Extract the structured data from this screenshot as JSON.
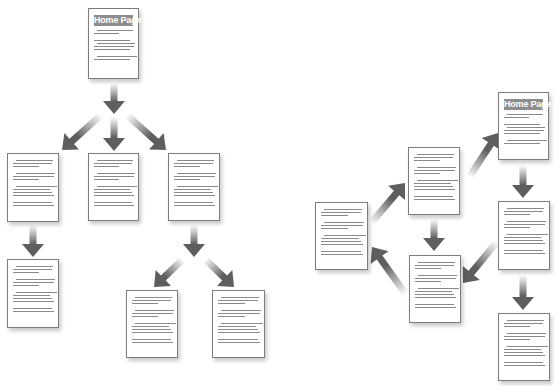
{
  "diagram": {
    "left_title_label": "Hierarchical site structure",
    "right_title_label": "Networked site structure",
    "home_label": "Home Page",
    "colors": {
      "arrow": "#5e5e5e",
      "page_border": "#7d7d7d",
      "header_bg": "#8d8d8d",
      "text_line": "#8a8a8a"
    },
    "hierarchy": {
      "nodes": [
        {
          "id": "home",
          "label": "Home Page",
          "x": 88,
          "y": 8,
          "w": 51,
          "h": 71
        },
        {
          "id": "l2a",
          "label": "",
          "x": 7,
          "y": 153,
          "w": 52,
          "h": 69
        },
        {
          "id": "l2b",
          "label": "",
          "x": 88,
          "y": 153,
          "w": 51,
          "h": 68
        },
        {
          "id": "l2c",
          "label": "",
          "x": 168,
          "y": 153,
          "w": 52,
          "h": 68
        },
        {
          "id": "l3a",
          "label": "",
          "x": 7,
          "y": 259,
          "w": 52,
          "h": 69
        },
        {
          "id": "l3b",
          "label": "",
          "x": 126,
          "y": 290,
          "w": 52,
          "h": 68
        },
        {
          "id": "l3c",
          "label": "",
          "x": 212,
          "y": 290,
          "w": 53,
          "h": 68
        }
      ],
      "edges": [
        [
          "home",
          "l2a"
        ],
        [
          "home",
          "l2b"
        ],
        [
          "home",
          "l2c"
        ],
        [
          "l2a",
          "l3a"
        ],
        [
          "l2c",
          "l3b"
        ],
        [
          "l2c",
          "l3c"
        ]
      ]
    },
    "network": {
      "nodes": [
        {
          "id": "home",
          "label": "Home Page",
          "x": 498,
          "y": 92,
          "w": 51,
          "h": 68
        },
        {
          "id": "b",
          "label": "",
          "x": 408,
          "y": 147,
          "w": 52,
          "h": 68
        },
        {
          "id": "c",
          "label": "",
          "x": 315,
          "y": 202,
          "w": 53,
          "h": 68
        },
        {
          "id": "d",
          "label": "",
          "x": 498,
          "y": 201,
          "w": 52,
          "h": 69
        },
        {
          "id": "e",
          "label": "",
          "x": 409,
          "y": 255,
          "w": 52,
          "h": 68
        },
        {
          "id": "f",
          "label": "",
          "x": 498,
          "y": 313,
          "w": 52,
          "h": 68
        }
      ],
      "edges": [
        [
          "b",
          "home"
        ],
        [
          "home",
          "d"
        ],
        [
          "d",
          "e"
        ],
        [
          "d",
          "f"
        ],
        [
          "b",
          "e"
        ],
        [
          "e",
          "c"
        ],
        [
          "c",
          "b"
        ]
      ]
    }
  }
}
